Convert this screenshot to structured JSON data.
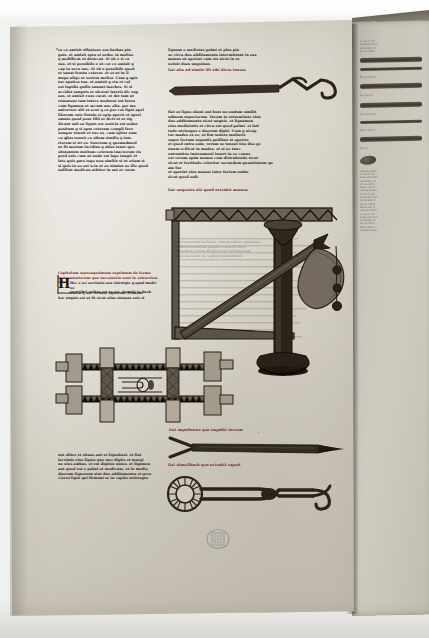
{
  "document": {
    "kind": "illuminated-manuscript-leaf",
    "script": "gothic-textualis",
    "language": "Latin (abbreviated)",
    "support": "parchment"
  },
  "colors": {
    "parchment": "#d9d5ca",
    "parchment_shadow": "#c6c1b5",
    "ink_brown": "#2a2018",
    "rubric_red": "#7d2a1c",
    "facing_page": "#c8c4ba",
    "gutter_shadow": "#2a241c",
    "backdrop": "#ffffff"
  },
  "left_column": {
    "lines": [
      "os ce amisit effusione eas barbas pin",
      "guis. et amisit epta et seduc in melius",
      "q mollificat et desiccat. Si sit e si ca",
      "sua, et si possibile e ut cor ce amisit q",
      "cap in secu unc. Si sit e possibile quod",
      "et sanat frustu ceterar. et os ut in il",
      "mере aliqo et sostria melior. Cum q apie",
      "tur epatica tua, et amisit q vin et cal",
      "est lapidis quilis sanant inaches. Si si",
      "accidat sanguis et ulcerat lateris dic sup",
      "eas, et amisit reus curat, et det tam ut",
      "remaneat tam intere moderat est fereu",
      "cum ligamen et secum unc alia. per mo",
      "universor alii et acut q ca per cas ligni apel",
      "liberum suis fistula et epta aperit et aperi",
      "omnia quod pour filii et dicit et et sig",
      "dicant sub ea lignis est sostria est uulne",
      "positum q si apm ceteram compli fere",
      "semper tenuit et tuo os. cum igitur eam",
      "cu alias tenuit ce alium similis q inte",
      "riorem si sit os. Sanctum q quemadmod",
      "ut fit motum lucidius q alius tenet quo",
      "obstantem multum ceteram inactorum vis",
      "pred suis cum ut unde est lago tangit et",
      "lato quis pars tego non similis si ut etiam si",
      "si quis in eo est scia et ao nimius ao illo quod",
      "nullitat modicus arbiter in ani et curat."
    ],
    "rubric_lines": [
      "Capitulum septuagesimum septimum de forma",
      "instrumentorum que necessaria sunt in extractione fer"
    ],
    "after_initial": [
      "Hec e sci sectionis seu chirurgie q apud medicos",
      "sunt libri quibus est se ore singulis in duab",
      "extremitatib q uoc virtutis lignorum. Primum",
      "hoc unguis est ut fit sicut alius sinuans suis si"
    ],
    "bottom_lines": [
      "aut aliter et ebano aut et lignobuxi. et fiat",
      "lacrimis eius lignis que uno digito et margi",
      "ne eius ambas. et est digitus unius. et ligamen",
      "aut quod est e palmi et modicum. et in medio",
      "duorum lignorum sint duo additamenta et gros",
      "ciores ligni qui firmant se in capita utriusque"
    ]
  },
  "right_column": {
    "top_lines": [
      "lignum e medietas palmi et plus pin",
      "se circa duo additamenta intermittunt in eas",
      "manus ut aperiat cum eis sicut in re",
      "uoluit duas unguinas."
    ],
    "caption_1": "fiat alia ad simile illi sibi dicta tenuis.",
    "mid_lines": [
      "fiat ex ligno ebani aut buxi secundum similit",
      "udinem superiorum. Verum in extremitate eius",
      "duo additamenta sicut unguis. et lignamen",
      "eius medietatis et circa est quod palmi, et lati",
      "tudo utriusque e duorum digiti. Cum q uicap",
      "tur mades ex eo, et fiat sedere mulieris",
      "super lectum regentis pedibus et aperire",
      "et quod extra eam, verum se teneat ista duo ge",
      "nuum scilicet in mades. et si eo tunc",
      "extremitas instrumenti insert in eo conus",
      "est verum apim manus cum distrahendo sicut",
      "sicut et fortitudo celeriter secundum quantitatem quam fue",
      "et aperiat eius manus inter faciem uulne",
      "sicut quod uult."
    ],
    "caption_2": "fiat unguinis alii quod extrahit annexa.",
    "caption_3": "fiat impellentis quo impellit ferrum.",
    "caption_4": "fiat almuffbach quo extrahit capud.",
    "balance_lines": [
      "instrumentum balistae cum pondere suspenso",
      "ad mensurandum pondus extracti ferri",
      "secundum artem medicorum antiquorum",
      "quod narratur in capitulo precedenti"
    ]
  },
  "verso_page": {
    "note": "facing leaf visible at gutter, surgical instruments in brown ink",
    "fragment_lines": [
      "et sit et sic",
      "cum uno lato",
      "sit firmat et",
      "sic ut aperi",
      "dicat unc q",
      "uerum sanat"
    ],
    "labels": [
      "Et sic aperit",
      "fiat ita ut",
      "extrahitur q",
      "de eo"
    ]
  },
  "figures": {
    "dilator": {
      "name": "vaginal-dilator-speculum",
      "caption": ""
    },
    "hook_instrument": {
      "name": "crank-hook-instrument"
    },
    "balance": {
      "name": "balance-with-suspended-weights"
    },
    "impeller": {
      "name": "impeller-spatula-instrument"
    },
    "almuffbach": {
      "name": "almuffbach-extractor-forceps"
    }
  },
  "stamp": {
    "name": "library-ownership-stamp",
    "text": ""
  }
}
